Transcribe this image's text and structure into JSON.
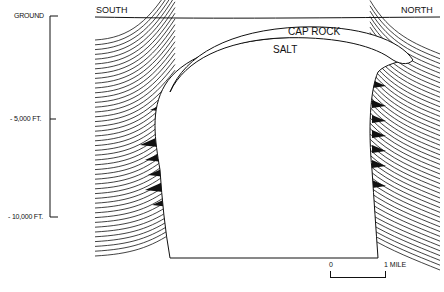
{
  "figure": {
    "type": "cross-section"
  },
  "depth_axis": {
    "ticks": [
      {
        "label": "GROUND",
        "y": 16
      },
      {
        "label": "- 5,000 FT.",
        "y": 119
      },
      {
        "label": "- 10,000 FT.",
        "y": 217
      }
    ]
  },
  "directions": {
    "left": "SOUTH",
    "right": "NORTH"
  },
  "bodies": {
    "cap_rock": "CAP ROCK",
    "salt": "SALT"
  },
  "scale_bar": {
    "start": "0",
    "end": "1 MILE"
  },
  "colors": {
    "ink": "#111111",
    "background": "#ffffff"
  }
}
